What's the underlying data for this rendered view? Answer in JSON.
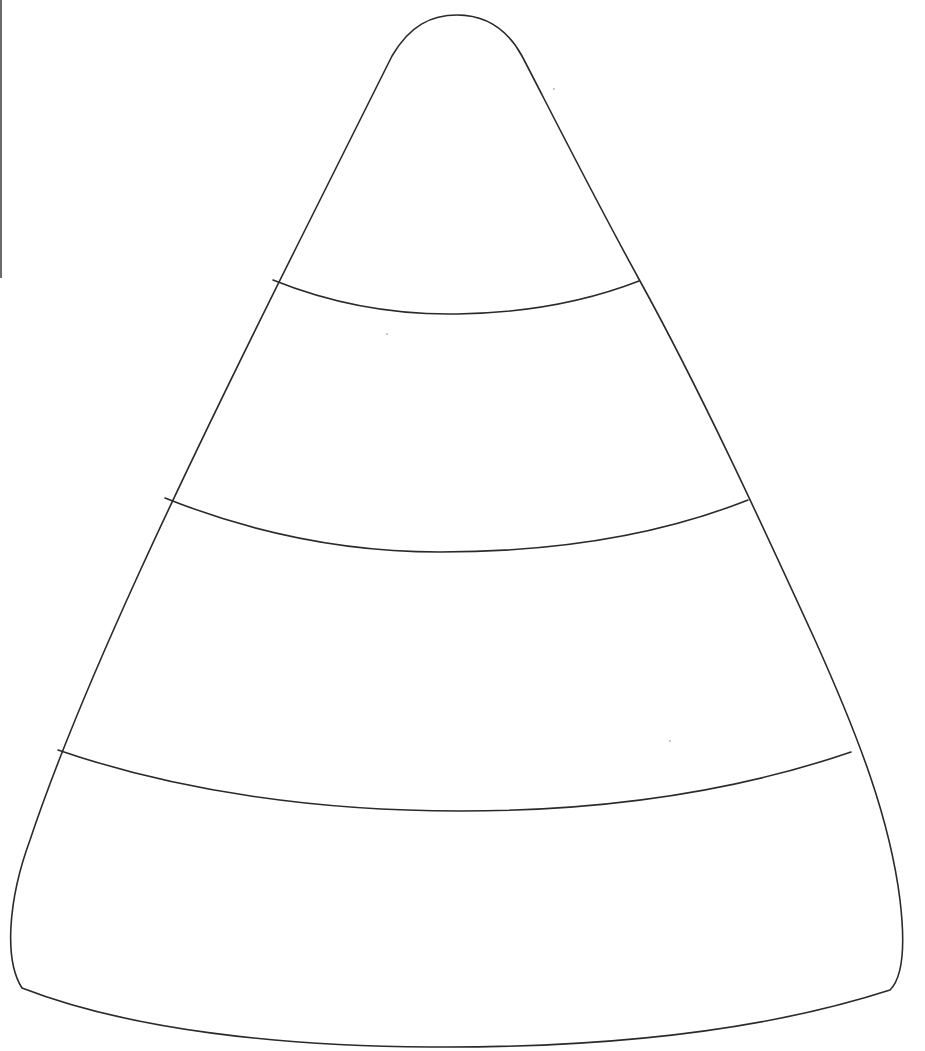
{
  "page": {
    "background": "#ffffff"
  },
  "drawing": {
    "subject": "candy-corn-outline",
    "stroke_color": "#2a2a2a",
    "stroke_width": 1.6,
    "outline_path": "M 22 988 C 4 960, 8 900, 30 840 C 80 690, 180 480, 300 240 C 340 160, 370 100, 392 56 C 410 25, 432 15, 457 15 C 482 15, 505 25, 522 56 C 545 100, 590 190, 640 281 C 700 390, 760 520, 815 640 C 860 740, 890 820, 900 900 C 906 950, 902 978, 890 990 C 760 1032, 600 1048, 430 1047 C 280 1046, 130 1030, 22 988 Z",
    "bands": [
      {
        "name": "band-line-1",
        "path": "M 273 280 C 335 305, 395 315, 457 314 C 525 313, 585 302, 639 281"
      },
      {
        "name": "band-line-2",
        "path": "M 165 498 C 250 532, 340 552, 440 552 C 560 552, 660 535, 748 500"
      },
      {
        "name": "band-line-3",
        "path": "M 58 750 C 180 792, 320 811, 460 811 C 610 811, 740 790, 851 752"
      }
    ]
  },
  "artifacts": {
    "left_edge_mark_color": "#6b6b6b",
    "specks": [
      {
        "x": 553,
        "y": 88
      },
      {
        "x": 386,
        "y": 333
      },
      {
        "x": 669,
        "y": 740
      }
    ]
  }
}
